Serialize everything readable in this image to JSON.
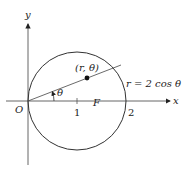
{
  "diagram": {
    "type": "polar-circle",
    "equation_label": "r = 2 cos θ",
    "point_label": "(r, θ)",
    "angle_label": "θ",
    "origin_label": "O",
    "focus_label": "F",
    "x_axis_label": "x",
    "y_axis_label": "y",
    "tick_labels": [
      "1",
      "2"
    ],
    "colors": {
      "stroke": "#333333",
      "background": "#ffffff"
    }
  }
}
